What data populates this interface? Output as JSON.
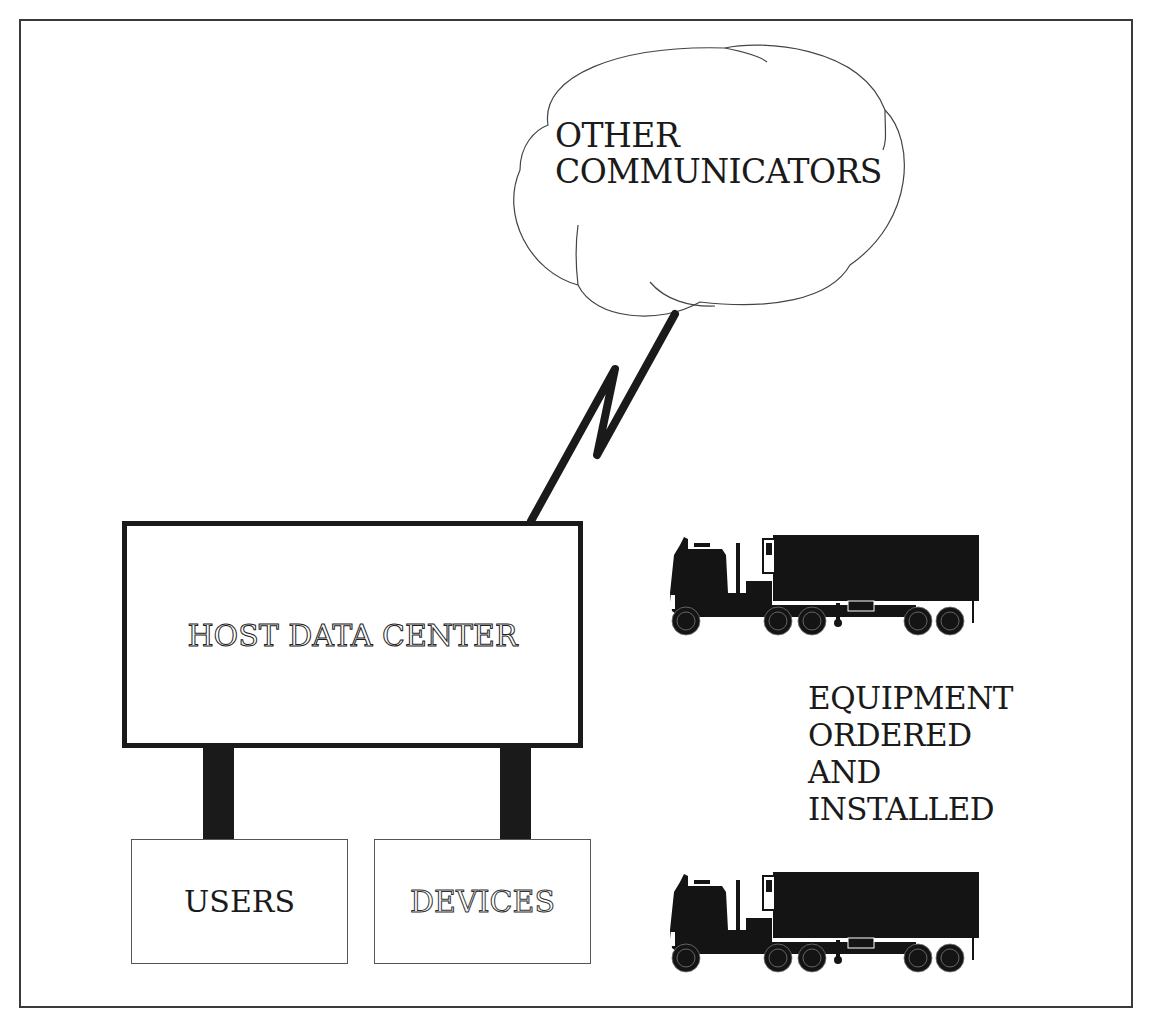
{
  "diagram": {
    "cloud": {
      "label_line1": "OTHER",
      "label_line2": "COMMUNICATORS"
    },
    "host": {
      "label": "HOST DATA CENTER"
    },
    "users": {
      "label": "USERS"
    },
    "devices": {
      "label": "DEVICES"
    },
    "equipment": {
      "line1": "EQUIPMENT",
      "line2": "ORDERED",
      "line3": "AND",
      "line4": "INSTALLED"
    },
    "icons": {
      "truck_top": "semi-truck-icon",
      "truck_bottom": "semi-truck-icon",
      "link": "lightning-link-icon",
      "cloud": "cloud-icon"
    },
    "colors": {
      "ink": "#1a1a1a",
      "background": "#ffffff",
      "frame": "#3a3a3a"
    }
  }
}
